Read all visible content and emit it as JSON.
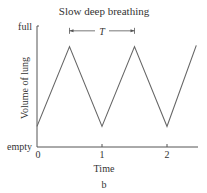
{
  "chart_data": {
    "type": "line",
    "title": "Slow deep breathing",
    "xlabel": "Time",
    "ylabel": "Volume of lung",
    "caption": "b",
    "xlim": [
      0,
      2.5
    ],
    "ylim": [
      0,
      1
    ],
    "x_ticks": [
      0,
      1,
      2
    ],
    "x_tick_labels": [
      "0",
      "1",
      "2"
    ],
    "y_tick_labels": [
      {
        "value": 1,
        "label": "full"
      },
      {
        "value": 0,
        "label": "empty"
      }
    ],
    "series": [
      {
        "name": "lung volume",
        "x": [
          0,
          0.5,
          1.0,
          1.5,
          2.0,
          2.45
        ],
        "y": [
          0.17,
          0.83,
          0.17,
          0.83,
          0.17,
          0.84
        ]
      }
    ],
    "annotations": [
      {
        "label": "T",
        "type": "period-arrow",
        "x_start": 0.5,
        "x_end": 1.5,
        "y": 0.96
      }
    ],
    "grid": false
  }
}
